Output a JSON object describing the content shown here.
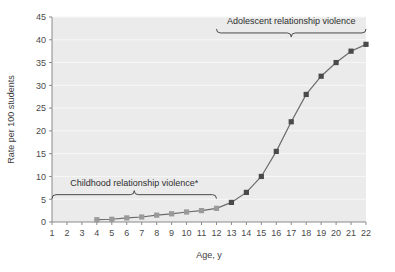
{
  "chart_data": {
    "type": "line",
    "title": "",
    "xlabel": "Age, y",
    "ylabel": "Rate per 100 students",
    "xlim": [
      1,
      22
    ],
    "ylim": [
      0,
      45
    ],
    "xticks": [
      1,
      2,
      3,
      4,
      5,
      6,
      7,
      8,
      9,
      10,
      11,
      12,
      13,
      14,
      15,
      16,
      17,
      18,
      19,
      20,
      21,
      22
    ],
    "yticks": [
      0,
      5,
      10,
      15,
      20,
      25,
      30,
      35,
      40,
      45
    ],
    "grid": "horizontal",
    "legend": "none",
    "x": [
      4,
      5,
      6,
      7,
      8,
      9,
      10,
      11,
      12,
      13,
      14,
      15,
      16,
      17,
      18,
      19,
      20,
      21,
      22
    ],
    "values": [
      0.5,
      0.6,
      0.9,
      1.1,
      1.5,
      1.8,
      2.2,
      2.5,
      3.0,
      4.3,
      6.5,
      10.0,
      15.5,
      22.0,
      28.0,
      32.0,
      35.0,
      37.5,
      39.0
    ],
    "series": [
      {
        "name": "Childhood relationship violence",
        "x": [
          4,
          5,
          6,
          7,
          8,
          9,
          10,
          11,
          12
        ],
        "values": [
          0.5,
          0.6,
          0.9,
          1.1,
          1.5,
          1.8,
          2.2,
          2.5,
          3.0
        ],
        "marker_color": "#9a9a9a",
        "line_color": "#6b6b6b"
      },
      {
        "name": "Adolescent relationship violence",
        "x": [
          13,
          14,
          15,
          16,
          17,
          18,
          19,
          20,
          21,
          22
        ],
        "values": [
          4.3,
          6.5,
          10.0,
          15.5,
          22.0,
          28.0,
          32.0,
          35.0,
          37.5,
          39.0
        ],
        "marker_color": "#4a4a4a",
        "line_color": "#4a4a4a"
      }
    ],
    "annotations": [
      {
        "id": "childhood-bracket",
        "label": "Childhood relationship violence*",
        "x_start": 1,
        "x_end": 12,
        "y": 6
      },
      {
        "id": "adolescent-bracket",
        "label": "Adolescent relationship violence",
        "x_start": 12,
        "x_end": 22,
        "y": 41.5
      }
    ],
    "colors": {
      "plot_background": "#ebebeb",
      "gridline": "#f7f7f7",
      "axis": "#8a8a8a",
      "text": "#3a3a3a",
      "childhood_marker": "#9a9a9a",
      "adolescent_marker": "#4a4a4a"
    }
  },
  "axes": {
    "y_title": "Rate per 100 students",
    "x_title": "Age, y",
    "y_tick_labels": [
      "0",
      "5",
      "10",
      "15",
      "20",
      "25",
      "30",
      "35",
      "40",
      "45"
    ],
    "x_tick_labels": [
      "1",
      "2",
      "3",
      "4",
      "5",
      "6",
      "7",
      "8",
      "9",
      "10",
      "11",
      "12",
      "13",
      "14",
      "15",
      "16",
      "17",
      "18",
      "19",
      "20",
      "21",
      "22"
    ]
  },
  "annotations": {
    "childhood_label": "Childhood relationship violence*",
    "adolescent_label": "Adolescent relationship violence"
  }
}
